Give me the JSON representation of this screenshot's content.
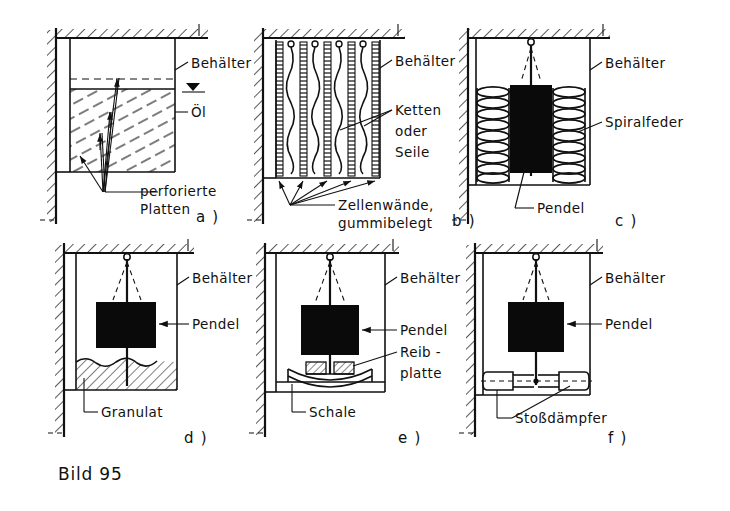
{
  "figure": {
    "caption": "Bild 95",
    "background_color": "#ffffff",
    "ink_color": "#111111",
    "mass_color": "#0a0a0a"
  },
  "panels": [
    {
      "id": "a",
      "id_label": "a )",
      "name": "oil-bath-with-perforated-plates",
      "labels": [
        {
          "key": "container",
          "text": "Behälter"
        },
        {
          "key": "oil",
          "text": "Öl"
        },
        {
          "key": "plates_line1",
          "text": "perforierte"
        },
        {
          "key": "plates_line2",
          "text": "Platten"
        }
      ]
    },
    {
      "id": "b",
      "id_label": "b )",
      "name": "cell-walls-with-chains",
      "labels": [
        {
          "key": "container",
          "text": "Behälter"
        },
        {
          "key": "chains_line1",
          "text": "Ketten"
        },
        {
          "key": "chains_line2",
          "text": "oder"
        },
        {
          "key": "chains_line3",
          "text": "Seile"
        },
        {
          "key": "cells_line1",
          "text": "Zellenwände,"
        },
        {
          "key": "cells_line2",
          "text": "gummibelegt"
        }
      ]
    },
    {
      "id": "c",
      "id_label": "c )",
      "name": "pendulum-with-coil-springs",
      "labels": [
        {
          "key": "container",
          "text": "Behälter"
        },
        {
          "key": "spring",
          "text": "Spiralfeder"
        },
        {
          "key": "pendulum",
          "text": "Pendel"
        }
      ]
    },
    {
      "id": "d",
      "id_label": "d )",
      "name": "pendulum-in-granulate",
      "labels": [
        {
          "key": "container",
          "text": "Behälter"
        },
        {
          "key": "pendulum",
          "text": "Pendel"
        },
        {
          "key": "granulate",
          "text": "Granulat"
        }
      ]
    },
    {
      "id": "e",
      "id_label": "e )",
      "name": "pendulum-with-friction-plate-on-bowl",
      "labels": [
        {
          "key": "container",
          "text": "Behälter"
        },
        {
          "key": "pendulum",
          "text": "Pendel"
        },
        {
          "key": "friction_line1",
          "text": "Reib -"
        },
        {
          "key": "friction_line2",
          "text": "platte"
        },
        {
          "key": "bowl",
          "text": "Schale"
        }
      ]
    },
    {
      "id": "f",
      "id_label": "f )",
      "name": "pendulum-with-shock-absorbers",
      "labels": [
        {
          "key": "container",
          "text": "Behälter"
        },
        {
          "key": "pendulum",
          "text": "Pendel"
        },
        {
          "key": "damper",
          "text": "Stoßdämpfer"
        }
      ]
    }
  ]
}
